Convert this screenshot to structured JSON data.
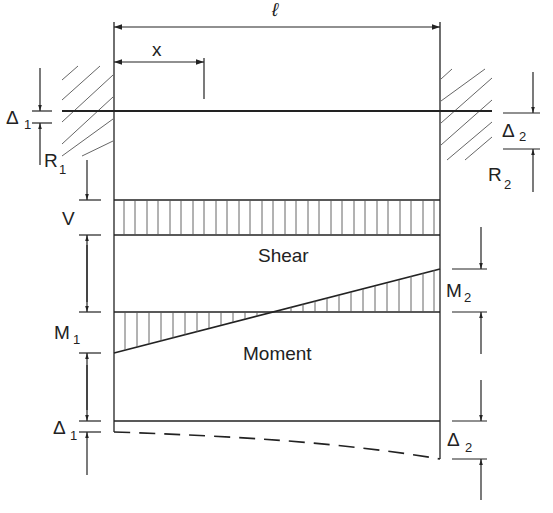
{
  "diagram": {
    "type": "beam-fixed-ends-support-settlement",
    "labels": {
      "span": "ℓ",
      "position": "x",
      "delta1_main": "Δ",
      "delta1_sub": "1",
      "delta2_main": "Δ",
      "delta2_sub": "2",
      "r1_main": "R",
      "r1_sub": "1",
      "r2_main": "R",
      "r2_sub": "2",
      "shear_value": "V",
      "m1_main": "M",
      "m1_sub": "1",
      "m2_main": "M",
      "m2_sub": "2",
      "shear_caption": "Shear",
      "moment_caption": "Moment"
    },
    "colors": {
      "line": "#222222",
      "hatch": "#555555",
      "background": "#ffffff"
    }
  }
}
